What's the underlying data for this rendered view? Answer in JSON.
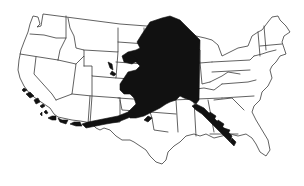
{
  "map": {
    "subject": "Contiguous United States with Alaska silhouette overlaid for size comparison",
    "base_layer": "US state boundary outlines",
    "overlay_layer": "Alaska (solid black)",
    "colors": {
      "background": "#ffffff",
      "state_fill": "#ffffff",
      "state_stroke": "#3a3a3a",
      "overlay_fill": "#111111"
    },
    "labels": []
  }
}
